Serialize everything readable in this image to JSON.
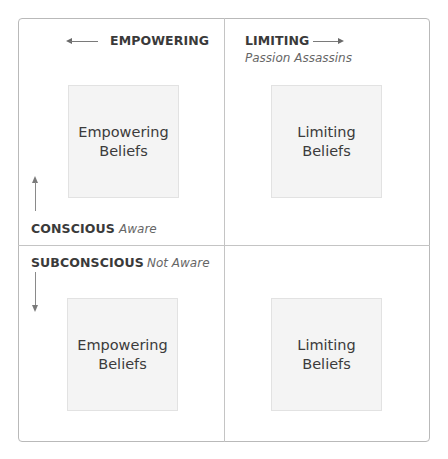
{
  "axes": {
    "empowering": {
      "label": "EMPOWERING",
      "direction": "left"
    },
    "limiting": {
      "label": "LIMITING",
      "sublabel": "Passion Assassins",
      "direction": "right"
    },
    "conscious": {
      "label": "CONSCIOUS",
      "sublabel": "Aware",
      "direction": "up"
    },
    "subconscious": {
      "label": "SUBCONSCIOUS",
      "sublabel": "Not Aware",
      "direction": "down"
    }
  },
  "quadrants": [
    {
      "position": "top-left",
      "line1": "Empowering",
      "line2": "Beliefs"
    },
    {
      "position": "top-right",
      "line1": "Limiting",
      "line2": "Beliefs"
    },
    {
      "position": "bottom-left",
      "line1": "Empowering",
      "line2": "Beliefs"
    },
    {
      "position": "bottom-right",
      "line1": "Limiting",
      "line2": "Beliefs"
    }
  ],
  "colors": {
    "border": "#b9b9b9",
    "box_fill": "#f4f4f4",
    "text": "#3a3a3a",
    "subtext": "#666666"
  }
}
